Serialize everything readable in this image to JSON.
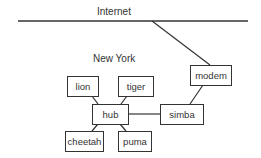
{
  "labels": {
    "internet": "Internet",
    "location": "New York"
  },
  "nodes": {
    "lion": "lion",
    "tiger": "tiger",
    "hub": "hub",
    "cheetah": "cheetah",
    "puma": "puma",
    "simba": "simba",
    "modem": "modem"
  },
  "colors": {
    "line": "#333333",
    "background": "#ffffff"
  }
}
